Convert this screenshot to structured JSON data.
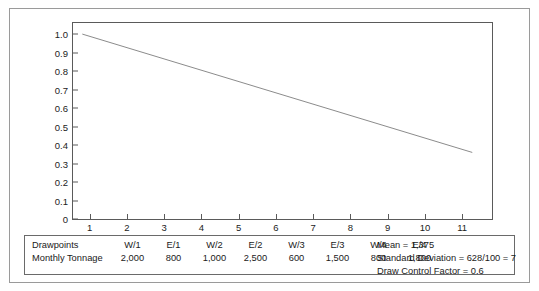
{
  "chart_data": {
    "type": "line",
    "title": "",
    "xlabel": "Standard Deviation × 100 of Tonnage of Working Drawpoints",
    "ylabel": "",
    "xlim": [
      0.55,
      11.8
    ],
    "ylim": [
      0,
      1.06
    ],
    "grid": false,
    "legend": "none",
    "xticks": [
      "1",
      "2",
      "3",
      "4",
      "5",
      "6",
      "7",
      "8",
      "9",
      "10",
      "11"
    ],
    "xtick_values": [
      1,
      2,
      3,
      4,
      5,
      6,
      7,
      8,
      9,
      10,
      11
    ],
    "yticks": [
      "0",
      "0.1",
      "0.2",
      "0.3",
      "0.4",
      "0.5",
      "0.6",
      "0.7",
      "0.8",
      "0.9",
      "1.0"
    ],
    "ytick_values": [
      0,
      0.1,
      0.2,
      0.3,
      0.4,
      0.5,
      0.6,
      0.7,
      0.8,
      0.9,
      1.0
    ],
    "series": [
      {
        "name": "Draw Control Factor",
        "x": [
          0.8,
          11.27
        ],
        "values": [
          1.0,
          0.36
        ],
        "color": "#2b2b2b"
      }
    ]
  },
  "table": {
    "rows": [
      {
        "label": "Drawpoints",
        "cells": [
          "W/1",
          "E/1",
          "W/2",
          "E/2",
          "W/3",
          "E/3",
          "W/4",
          "E/4"
        ]
      },
      {
        "label": "Monthly Tonnage",
        "cells": [
          "2,000",
          "800",
          "1,000",
          "2,500",
          "600",
          "1,500",
          "800",
          "1,800"
        ]
      }
    ],
    "notes": [
      "Mean = 1,375",
      "Standard Deviation = 628/100 = 7",
      "Draw Control Factor = 0.6"
    ]
  },
  "colors": {
    "line": "#2b2b2b",
    "frame": "#5a5a5a",
    "outer_frame": "#9a9a9a",
    "text": "#1a1a1a"
  }
}
